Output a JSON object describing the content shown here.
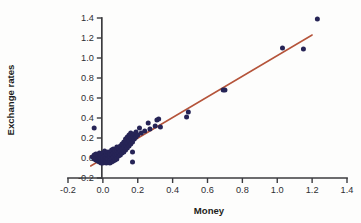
{
  "chart_data": {
    "type": "scatter",
    "title": "",
    "xlabel": "Money",
    "ylabel": "Exchange rates",
    "xlim": [
      -0.2,
      1.4
    ],
    "ylim": [
      -0.2,
      1.4
    ],
    "xticks": [
      -0.2,
      0.0,
      0.2,
      0.4,
      0.6,
      0.8,
      1.0,
      1.2,
      1.4
    ],
    "xtick_labels": [
      "-0.2",
      "0.0",
      "0.2",
      "0.4",
      "0.6",
      "0.8",
      "1.0",
      "1.2",
      "1.4"
    ],
    "yticks": [
      -0.2,
      0.0,
      0.2,
      0.4,
      0.6,
      0.8,
      1.0,
      1.2,
      1.4
    ],
    "ytick_labels": [
      "-0.2",
      "0.0",
      "0.2",
      "0.4",
      "0.6",
      "0.8",
      "1.0",
      "1.2",
      "1.4"
    ],
    "grid": false,
    "legend": false,
    "point_color": "#262456",
    "line_color": "#b5543a",
    "axis_color": "#3b3b3f",
    "background_color": "#fdfdfc",
    "series": [
      {
        "name": "observations",
        "marker": "circle",
        "points": [
          [
            -0.05,
            0.3
          ],
          [
            -0.06,
            0.01
          ],
          [
            -0.05,
            -0.01
          ],
          [
            -0.05,
            0.03
          ],
          [
            -0.04,
            -0.02
          ],
          [
            -0.04,
            0.0
          ],
          [
            -0.04,
            0.04
          ],
          [
            -0.03,
            -0.03
          ],
          [
            -0.03,
            -0.01
          ],
          [
            -0.03,
            0.02
          ],
          [
            -0.02,
            -0.04
          ],
          [
            -0.02,
            -0.02
          ],
          [
            -0.02,
            0.01
          ],
          [
            -0.02,
            0.05
          ],
          [
            -0.01,
            -0.05
          ],
          [
            -0.01,
            -0.03
          ],
          [
            -0.01,
            0.0
          ],
          [
            -0.01,
            0.03
          ],
          [
            0.0,
            -0.05
          ],
          [
            0.0,
            -0.02
          ],
          [
            0.0,
            0.01
          ],
          [
            0.0,
            0.05
          ],
          [
            0.01,
            -0.04
          ],
          [
            0.01,
            -0.01
          ],
          [
            0.01,
            0.02
          ],
          [
            0.01,
            0.07
          ],
          [
            0.02,
            -0.05
          ],
          [
            0.02,
            -0.02
          ],
          [
            0.02,
            0.01
          ],
          [
            0.02,
            0.04
          ],
          [
            0.03,
            -0.04
          ],
          [
            0.03,
            -0.01
          ],
          [
            0.03,
            0.03
          ],
          [
            0.03,
            0.06
          ],
          [
            0.04,
            -0.05
          ],
          [
            0.04,
            -0.02
          ],
          [
            0.04,
            0.02
          ],
          [
            0.04,
            0.05
          ],
          [
            0.05,
            -0.04
          ],
          [
            0.05,
            0.0
          ],
          [
            0.05,
            0.04
          ],
          [
            0.05,
            0.08
          ],
          [
            0.06,
            -0.03
          ],
          [
            0.06,
            0.01
          ],
          [
            0.06,
            0.05
          ],
          [
            0.06,
            0.09
          ],
          [
            0.07,
            -0.02
          ],
          [
            0.07,
            0.03
          ],
          [
            0.07,
            0.07
          ],
          [
            0.08,
            -0.01
          ],
          [
            0.08,
            0.04
          ],
          [
            0.08,
            0.08
          ],
          [
            0.08,
            0.11
          ],
          [
            0.09,
            0.02
          ],
          [
            0.09,
            0.06
          ],
          [
            0.09,
            0.1
          ],
          [
            0.1,
            0.03
          ],
          [
            0.1,
            0.07
          ],
          [
            0.1,
            0.12
          ],
          [
            0.11,
            0.05
          ],
          [
            0.11,
            0.09
          ],
          [
            0.11,
            0.14
          ],
          [
            0.12,
            0.06
          ],
          [
            0.12,
            0.11
          ],
          [
            0.12,
            0.16
          ],
          [
            0.13,
            0.08
          ],
          [
            0.13,
            0.13
          ],
          [
            0.13,
            0.19
          ],
          [
            0.14,
            0.1
          ],
          [
            0.14,
            0.15
          ],
          [
            0.14,
            0.21
          ],
          [
            0.15,
            0.12
          ],
          [
            0.15,
            0.17
          ],
          [
            0.15,
            0.23
          ],
          [
            0.16,
            0.14
          ],
          [
            0.16,
            0.2
          ],
          [
            0.16,
            0.25
          ],
          [
            0.17,
            -0.04
          ],
          [
            0.17,
            0.06
          ],
          [
            0.17,
            0.16
          ],
          [
            0.17,
            0.22
          ],
          [
            0.18,
            0.19
          ],
          [
            0.18,
            0.24
          ],
          [
            0.19,
            0.21
          ],
          [
            0.19,
            0.26
          ],
          [
            0.2,
            0.23
          ],
          [
            0.21,
            0.3
          ],
          [
            0.22,
            0.25
          ],
          [
            0.24,
            0.27
          ],
          [
            0.26,
            0.35
          ],
          [
            0.27,
            0.29
          ],
          [
            0.3,
            0.32
          ],
          [
            0.31,
            0.38
          ],
          [
            0.32,
            0.39
          ],
          [
            0.33,
            0.31
          ],
          [
            0.48,
            0.41
          ],
          [
            0.49,
            0.46
          ],
          [
            0.69,
            0.68
          ],
          [
            0.7,
            0.68
          ],
          [
            1.03,
            1.1
          ],
          [
            1.15,
            1.09
          ],
          [
            1.23,
            1.39
          ]
        ]
      }
    ],
    "fit_line": {
      "name": "regression-line",
      "x_start": -0.07,
      "y_start": -0.08,
      "x_end": 1.2,
      "y_end": 1.23
    }
  }
}
